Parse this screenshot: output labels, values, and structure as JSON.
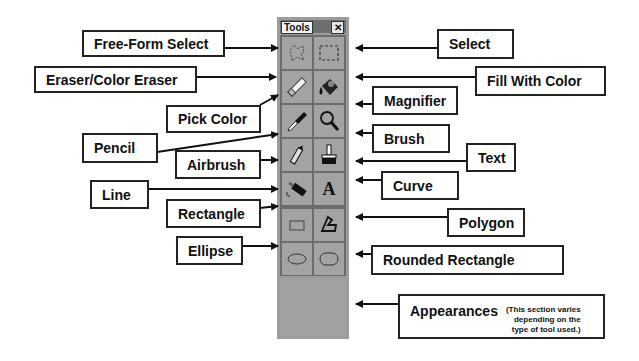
{
  "window": {
    "title": "Tools",
    "close_glyph": "✕"
  },
  "tools": [
    {
      "name": "Free-Form Select",
      "icon": "free-form-select-icon"
    },
    {
      "name": "Select",
      "icon": "select-icon"
    },
    {
      "name": "Eraser/Color Eraser",
      "icon": "eraser-icon"
    },
    {
      "name": "Fill With Color",
      "icon": "fill-bucket-icon"
    },
    {
      "name": "Pick Color",
      "icon": "eyedropper-icon"
    },
    {
      "name": "Magnifier",
      "icon": "magnifier-icon"
    },
    {
      "name": "Pencil",
      "icon": "pencil-icon"
    },
    {
      "name": "Brush",
      "icon": "brush-icon"
    },
    {
      "name": "Airbrush",
      "icon": "airbrush-icon"
    },
    {
      "name": "Text",
      "icon": "text-icon",
      "glyph": "A"
    },
    {
      "name": "Line",
      "icon": "line-icon"
    },
    {
      "name": "Curve",
      "icon": "curve-icon"
    },
    {
      "name": "Rectangle",
      "icon": "rectangle-icon"
    },
    {
      "name": "Polygon",
      "icon": "polygon-icon"
    },
    {
      "name": "Ellipse",
      "icon": "ellipse-icon"
    },
    {
      "name": "Rounded Rectangle",
      "icon": "rounded-rectangle-icon"
    }
  ],
  "labels": {
    "free_form_select": "Free-Form Select",
    "select": "Select",
    "eraser": "Eraser/Color Eraser",
    "fill": "Fill With Color",
    "pick_color": "Pick Color",
    "magnifier": "Magnifier",
    "pencil": "Pencil",
    "brush": "Brush",
    "airbrush": "Airbrush",
    "text": "Text",
    "line": "Line",
    "curve": "Curve",
    "rectangle": "Rectangle",
    "polygon": "Polygon",
    "ellipse": "Ellipse",
    "rounded_rectangle": "Rounded Rectangle",
    "appearances": "Appearances",
    "appearances_note_1": "(This section varies",
    "appearances_note_2": "depending on the",
    "appearances_note_3": "type of tool used.)"
  }
}
